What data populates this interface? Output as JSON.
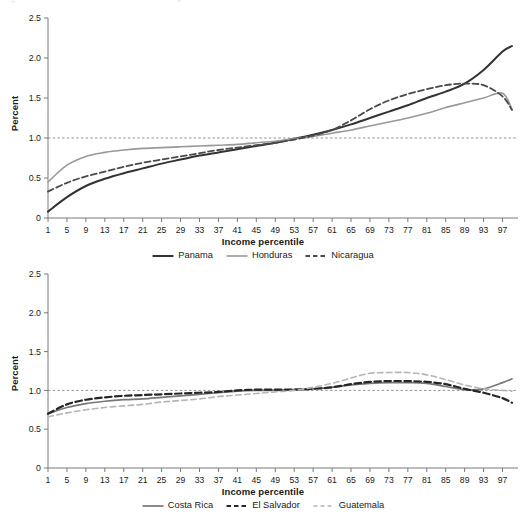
{
  "figure": {
    "ylabel": "Percent",
    "xlabel": "Income percentile"
  },
  "colors": {
    "dark": "#333333",
    "gray": "#999999",
    "light_gray": "#bbbbbb",
    "axis": "#7a7a7a",
    "text": "#1a1a1a",
    "gridline": "#888888"
  },
  "chart_data": [
    {
      "type": "line",
      "id": "top",
      "title": "",
      "xlabel": "Income percentile",
      "ylabel": "Percent",
      "xlim": [
        1,
        99
      ],
      "ylim": [
        0,
        2.5
      ],
      "yticks": [
        0,
        0.5,
        1.0,
        1.5,
        2.0,
        2.5
      ],
      "ytick_labels": [
        "0",
        "0.5",
        "1.0",
        "1.5",
        "2.0",
        "2.5"
      ],
      "xticks": [
        1,
        5,
        9,
        13,
        17,
        21,
        25,
        29,
        33,
        37,
        41,
        45,
        49,
        53,
        57,
        61,
        65,
        69,
        73,
        77,
        81,
        85,
        89,
        93,
        97
      ],
      "xtick_labels": [
        "1",
        "5",
        "9",
        "13",
        "17",
        "21",
        "25",
        "29",
        "33",
        "37",
        "41",
        "45",
        "49",
        "53",
        "57",
        "61",
        "65",
        "69",
        "73",
        "77",
        "81",
        "85",
        "89",
        "93",
        "97"
      ],
      "grid": false,
      "reference_line": {
        "y": 1.0,
        "style": "dotted"
      },
      "legend_position": "below",
      "x": [
        1,
        5,
        9,
        13,
        17,
        21,
        25,
        29,
        33,
        37,
        41,
        45,
        49,
        53,
        57,
        61,
        65,
        69,
        73,
        77,
        81,
        85,
        89,
        93,
        97,
        99
      ],
      "series": [
        {
          "name": "Panama",
          "style": "solid",
          "color": "#333333",
          "width": 2.0,
          "values": [
            0.08,
            0.26,
            0.4,
            0.49,
            0.56,
            0.62,
            0.68,
            0.73,
            0.78,
            0.82,
            0.86,
            0.9,
            0.94,
            0.99,
            1.04,
            1.1,
            1.17,
            1.25,
            1.33,
            1.41,
            1.5,
            1.58,
            1.68,
            1.85,
            2.08,
            2.15
          ]
        },
        {
          "name": "Honduras",
          "style": "solid",
          "color": "#999999",
          "width": 1.6,
          "values": [
            0.45,
            0.66,
            0.77,
            0.82,
            0.85,
            0.87,
            0.88,
            0.89,
            0.9,
            0.91,
            0.92,
            0.94,
            0.96,
            0.99,
            1.02,
            1.06,
            1.1,
            1.15,
            1.2,
            1.25,
            1.31,
            1.38,
            1.44,
            1.5,
            1.56,
            1.36
          ]
        },
        {
          "name": "Nicaragua",
          "style": "dashed",
          "color": "#4a4a4a",
          "width": 1.8,
          "values": [
            0.33,
            0.44,
            0.52,
            0.58,
            0.64,
            0.69,
            0.73,
            0.77,
            0.81,
            0.85,
            0.88,
            0.91,
            0.94,
            0.98,
            1.03,
            1.1,
            1.22,
            1.36,
            1.47,
            1.55,
            1.61,
            1.66,
            1.68,
            1.66,
            1.52,
            1.35
          ]
        }
      ]
    },
    {
      "type": "line",
      "id": "bottom",
      "title": "",
      "xlabel": "Income percentile",
      "ylabel": "Percent",
      "xlim": [
        1,
        99
      ],
      "ylim": [
        0,
        2.5
      ],
      "yticks": [
        0,
        0.5,
        1.0,
        1.5,
        2.0,
        2.5
      ],
      "ytick_labels": [
        "0",
        "0.5",
        "1.0",
        "1.5",
        "2.0",
        "2.5"
      ],
      "xticks": [
        1,
        5,
        9,
        13,
        17,
        21,
        25,
        29,
        33,
        37,
        41,
        45,
        49,
        53,
        57,
        61,
        65,
        69,
        73,
        77,
        81,
        85,
        89,
        93,
        97
      ],
      "xtick_labels": [
        "1",
        "5",
        "9",
        "13",
        "17",
        "21",
        "25",
        "29",
        "33",
        "37",
        "41",
        "45",
        "49",
        "53",
        "57",
        "61",
        "65",
        "69",
        "73",
        "77",
        "81",
        "85",
        "89",
        "93",
        "97"
      ],
      "grid": false,
      "reference_line": {
        "y": 1.0,
        "style": "dotted"
      },
      "legend_position": "below",
      "x": [
        1,
        5,
        9,
        13,
        17,
        21,
        25,
        29,
        33,
        37,
        41,
        45,
        49,
        53,
        57,
        61,
        65,
        69,
        73,
        77,
        81,
        85,
        89,
        93,
        97,
        99
      ],
      "series": [
        {
          "name": "Costa Rica",
          "style": "solid",
          "color": "#777777",
          "width": 1.7,
          "values": [
            0.7,
            0.78,
            0.83,
            0.86,
            0.88,
            0.89,
            0.91,
            0.93,
            0.95,
            0.97,
            0.99,
            1.0,
            1.0,
            1.01,
            1.02,
            1.04,
            1.07,
            1.09,
            1.1,
            1.1,
            1.09,
            1.05,
            1.01,
            1.02,
            1.1,
            1.15
          ]
        },
        {
          "name": "El Salvador",
          "style": "dashed-bold",
          "color": "#262626",
          "width": 2.2,
          "values": [
            0.7,
            0.82,
            0.88,
            0.91,
            0.93,
            0.94,
            0.95,
            0.96,
            0.97,
            0.98,
            1.0,
            1.01,
            1.01,
            1.01,
            1.02,
            1.04,
            1.08,
            1.11,
            1.12,
            1.12,
            1.11,
            1.08,
            1.02,
            0.97,
            0.9,
            0.84
          ]
        },
        {
          "name": "Guatemala",
          "style": "dashed-light",
          "color": "#b5b5b5",
          "width": 1.6,
          "values": [
            0.66,
            0.71,
            0.75,
            0.78,
            0.8,
            0.82,
            0.85,
            0.87,
            0.89,
            0.92,
            0.94,
            0.96,
            0.98,
            1.0,
            1.04,
            1.09,
            1.16,
            1.22,
            1.23,
            1.23,
            1.2,
            1.14,
            1.07,
            1.02,
            1.0,
            0.99
          ]
        }
      ]
    }
  ]
}
